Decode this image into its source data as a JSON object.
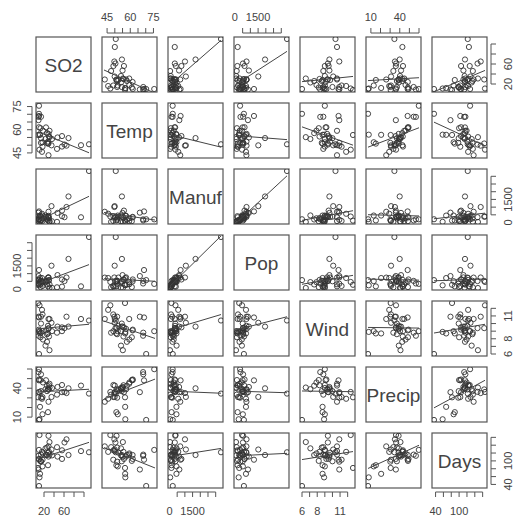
{
  "chart_data": {
    "type": "scatter",
    "title": "",
    "subtitle": "Scatterplot matrix (pairs) with fitted regression lines",
    "variables": [
      "SO2",
      "Temp",
      "Manuf",
      "Pop",
      "Wind",
      "Precip",
      "Days"
    ],
    "ranges": {
      "SO2": [
        8,
        110
      ],
      "Temp": [
        43,
        76
      ],
      "Manuf": [
        35,
        3344
      ],
      "Pop": [
        71,
        3369
      ],
      "Wind": [
        6,
        12.7
      ],
      "Precip": [
        7,
        60
      ],
      "Days": [
        36,
        166
      ]
    },
    "axis_ticks": {
      "top": [
        {
          "var": "Temp",
          "labels": [
            "45",
            "60",
            "75"
          ]
        },
        {
          "var": "Pop",
          "labels": [
            "0",
            "1500"
          ]
        },
        {
          "var": "Precip",
          "labels": [
            "10",
            "40"
          ]
        }
      ],
      "bottom": [
        {
          "var": "SO2",
          "labels": [
            "20",
            "60"
          ]
        },
        {
          "var": "Manuf",
          "labels": [
            "0",
            "1500"
          ]
        },
        {
          "var": "Wind",
          "labels": [
            "6",
            "8",
            "11"
          ]
        },
        {
          "var": "Days",
          "labels": [
            "40",
            "100"
          ]
        }
      ],
      "left": [
        {
          "var": "Temp",
          "labels": [
            "45",
            "60",
            "75"
          ]
        },
        {
          "var": "Pop",
          "labels": [
            "0",
            "1500"
          ]
        },
        {
          "var": "Precip",
          "labels": [
            "10",
            "40"
          ]
        }
      ],
      "right": [
        {
          "var": "SO2",
          "labels": [
            "20",
            "60"
          ]
        },
        {
          "var": "Manuf",
          "labels": [
            "0",
            "1500"
          ]
        },
        {
          "var": "Wind",
          "labels": [
            "6",
            "8",
            "11"
          ]
        },
        {
          "var": "Days",
          "labels": [
            "40",
            "100"
          ]
        }
      ]
    },
    "observations": [
      {
        "SO2": 10,
        "Temp": 70.3,
        "Manuf": 213,
        "Pop": 582,
        "Wind": 6.0,
        "Precip": 7.05,
        "Days": 36
      },
      {
        "SO2": 13,
        "Temp": 61.0,
        "Manuf": 91,
        "Pop": 132,
        "Wind": 8.2,
        "Precip": 48.52,
        "Days": 100
      },
      {
        "SO2": 12,
        "Temp": 56.7,
        "Manuf": 453,
        "Pop": 716,
        "Wind": 8.7,
        "Precip": 20.66,
        "Days": 67
      },
      {
        "SO2": 17,
        "Temp": 51.9,
        "Manuf": 454,
        "Pop": 515,
        "Wind": 9.0,
        "Precip": 12.95,
        "Days": 86
      },
      {
        "SO2": 56,
        "Temp": 49.1,
        "Manuf": 412,
        "Pop": 158,
        "Wind": 9.0,
        "Precip": 43.37,
        "Days": 127
      },
      {
        "SO2": 36,
        "Temp": 54.0,
        "Manuf": 80,
        "Pop": 80,
        "Wind": 9.0,
        "Precip": 40.25,
        "Days": 114
      },
      {
        "SO2": 29,
        "Temp": 57.3,
        "Manuf": 434,
        "Pop": 757,
        "Wind": 9.3,
        "Precip": 38.89,
        "Days": 111
      },
      {
        "SO2": 14,
        "Temp": 68.4,
        "Manuf": 136,
        "Pop": 529,
        "Wind": 8.8,
        "Precip": 54.47,
        "Days": 116
      },
      {
        "SO2": 10,
        "Temp": 75.5,
        "Manuf": 207,
        "Pop": 335,
        "Wind": 9.0,
        "Precip": 59.8,
        "Days": 128
      },
      {
        "SO2": 24,
        "Temp": 61.5,
        "Manuf": 368,
        "Pop": 497,
        "Wind": 9.1,
        "Precip": 48.34,
        "Days": 115
      },
      {
        "SO2": 110,
        "Temp": 50.6,
        "Manuf": 3344,
        "Pop": 3369,
        "Wind": 10.4,
        "Precip": 34.44,
        "Days": 122
      },
      {
        "SO2": 28,
        "Temp": 52.3,
        "Manuf": 361,
        "Pop": 746,
        "Wind": 9.7,
        "Precip": 38.74,
        "Days": 121
      },
      {
        "SO2": 17,
        "Temp": 49.0,
        "Manuf": 104,
        "Pop": 201,
        "Wind": 11.2,
        "Precip": 30.85,
        "Days": 103
      },
      {
        "SO2": 8,
        "Temp": 56.6,
        "Manuf": 125,
        "Pop": 277,
        "Wind": 12.7,
        "Precip": 30.58,
        "Days": 82
      },
      {
        "SO2": 30,
        "Temp": 55.6,
        "Manuf": 291,
        "Pop": 593,
        "Wind": 8.3,
        "Precip": 43.11,
        "Days": 123
      },
      {
        "SO2": 9,
        "Temp": 68.3,
        "Manuf": 204,
        "Pop": 361,
        "Wind": 8.4,
        "Precip": 56.77,
        "Days": 113
      },
      {
        "SO2": 47,
        "Temp": 55.0,
        "Manuf": 625,
        "Pop": 905,
        "Wind": 9.6,
        "Precip": 41.31,
        "Days": 111
      },
      {
        "SO2": 35,
        "Temp": 49.9,
        "Manuf": 1064,
        "Pop": 1513,
        "Wind": 10.1,
        "Precip": 30.96,
        "Days": 129
      },
      {
        "SO2": 29,
        "Temp": 43.5,
        "Manuf": 699,
        "Pop": 744,
        "Wind": 10.6,
        "Precip": 25.94,
        "Days": 137
      },
      {
        "SO2": 14,
        "Temp": 54.5,
        "Manuf": 381,
        "Pop": 507,
        "Wind": 10.0,
        "Precip": 37.0,
        "Days": 99
      },
      {
        "SO2": 56,
        "Temp": 55.9,
        "Manuf": 775,
        "Pop": 622,
        "Wind": 9.5,
        "Precip": 35.89,
        "Days": 105
      },
      {
        "SO2": 14,
        "Temp": 51.5,
        "Manuf": 181,
        "Pop": 347,
        "Wind": 10.9,
        "Precip": 30.18,
        "Days": 98
      },
      {
        "SO2": 11,
        "Temp": 56.8,
        "Manuf": 46,
        "Pop": 244,
        "Wind": 8.9,
        "Precip": 7.77,
        "Days": 58
      },
      {
        "SO2": 46,
        "Temp": 47.6,
        "Manuf": 44,
        "Pop": 116,
        "Wind": 8.8,
        "Precip": 33.36,
        "Days": 135
      },
      {
        "SO2": 11,
        "Temp": 47.1,
        "Manuf": 391,
        "Pop": 463,
        "Wind": 12.4,
        "Precip": 36.11,
        "Days": 166
      },
      {
        "SO2": 23,
        "Temp": 54.0,
        "Manuf": 462,
        "Pop": 453,
        "Wind": 7.1,
        "Precip": 39.04,
        "Days": 132
      },
      {
        "SO2": 65,
        "Temp": 49.7,
        "Manuf": 1007,
        "Pop": 751,
        "Wind": 10.9,
        "Precip": 34.99,
        "Days": 155
      },
      {
        "SO2": 26,
        "Temp": 51.5,
        "Manuf": 266,
        "Pop": 540,
        "Wind": 8.6,
        "Precip": 37.01,
        "Days": 134
      },
      {
        "SO2": 69,
        "Temp": 54.6,
        "Manuf": 1692,
        "Pop": 1950,
        "Wind": 9.6,
        "Precip": 39.93,
        "Days": 115
      },
      {
        "SO2": 61,
        "Temp": 50.4,
        "Manuf": 347,
        "Pop": 520,
        "Wind": 9.4,
        "Precip": 36.22,
        "Days": 147
      },
      {
        "SO2": 94,
        "Temp": 50.0,
        "Manuf": 343,
        "Pop": 179,
        "Wind": 10.6,
        "Precip": 42.75,
        "Days": 125
      },
      {
        "SO2": 10,
        "Temp": 61.6,
        "Manuf": 337,
        "Pop": 624,
        "Wind": 9.2,
        "Precip": 49.1,
        "Days": 105
      },
      {
        "SO2": 18,
        "Temp": 59.4,
        "Manuf": 275,
        "Pop": 448,
        "Wind": 7.9,
        "Precip": 46.0,
        "Days": 119
      },
      {
        "SO2": 9,
        "Temp": 66.2,
        "Manuf": 641,
        "Pop": 844,
        "Wind": 10.9,
        "Precip": 35.94,
        "Days": 78
      },
      {
        "SO2": 10,
        "Temp": 68.9,
        "Manuf": 721,
        "Pop": 1233,
        "Wind": 10.8,
        "Precip": 48.19,
        "Days": 103
      },
      {
        "SO2": 28,
        "Temp": 51.0,
        "Manuf": 137,
        "Pop": 176,
        "Wind": 8.7,
        "Precip": 15.17,
        "Days": 89
      },
      {
        "SO2": 31,
        "Temp": 59.3,
        "Manuf": 96,
        "Pop": 308,
        "Wind": 10.6,
        "Precip": 44.68,
        "Days": 116
      },
      {
        "SO2": 26,
        "Temp": 57.8,
        "Manuf": 197,
        "Pop": 299,
        "Wind": 7.6,
        "Precip": 42.59,
        "Days": 115
      },
      {
        "SO2": 29,
        "Temp": 51.1,
        "Manuf": 379,
        "Pop": 531,
        "Wind": 9.4,
        "Precip": 38.79,
        "Days": 164
      },
      {
        "SO2": 31,
        "Temp": 55.2,
        "Manuf": 35,
        "Pop": 71,
        "Wind": 6.5,
        "Precip": 40.75,
        "Days": 148
      },
      {
        "SO2": 16,
        "Temp": 45.7,
        "Manuf": 569,
        "Pop": 717,
        "Wind": 11.8,
        "Precip": 29.07,
        "Days": 123
      }
    ],
    "regression_lines": true,
    "grid": false,
    "legend": null,
    "marker": "open-circle"
  }
}
